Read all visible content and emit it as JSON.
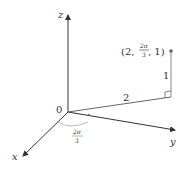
{
  "diagram": {
    "axes": {
      "x_label": "x",
      "y_label": "y",
      "z_label": "z",
      "origin_label": "0"
    },
    "point": {
      "label_open": "(2,",
      "theta_num": "2π",
      "theta_den": "3",
      "label_close": ", 1)"
    },
    "radius_label": "2",
    "height_label": "1",
    "angle": {
      "num": "2π",
      "den": "3"
    },
    "colors": {
      "axis": "#333333",
      "guide": "#888888",
      "arc": "#aaaaaa"
    }
  }
}
